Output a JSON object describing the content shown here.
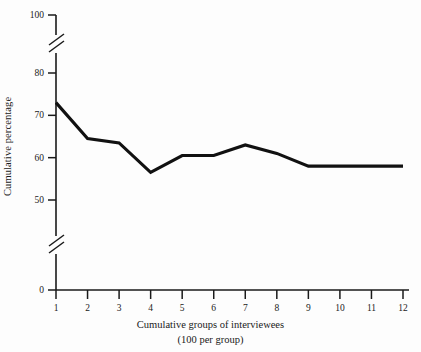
{
  "chart_data": {
    "type": "line",
    "title": "",
    "xlabel": "Cumulative groups of interviewees",
    "xlabel_sub": "(100 per group)",
    "ylabel": "Cumulative percentage",
    "x": [
      1,
      2,
      3,
      4,
      5,
      6,
      7,
      8,
      9,
      10,
      11,
      12
    ],
    "values": [
      73,
      64.5,
      63.5,
      56.5,
      60.5,
      60.5,
      63,
      61,
      58,
      58,
      58,
      58
    ],
    "series": [
      {
        "name": "Cumulative percentage",
        "values": [
          73,
          64.5,
          63.5,
          56.5,
          60.5,
          60.5,
          63,
          61,
          58,
          58,
          58,
          58
        ]
      }
    ],
    "xtick_labels": [
      "1",
      "2",
      "3",
      "4",
      "5",
      "6",
      "7",
      "8",
      "9",
      "10",
      "11",
      "12"
    ],
    "ytick_labels": [
      "0",
      "50",
      "60",
      "70",
      "80",
      "100"
    ],
    "ytick_values": [
      0,
      50,
      60,
      70,
      80,
      100
    ],
    "ylim": [
      0,
      100
    ],
    "xlim": [
      1,
      12
    ],
    "axis_breaks": [
      {
        "between": [
          0,
          50
        ],
        "style": "double-slash"
      },
      {
        "between": [
          80,
          100
        ],
        "style": "double-slash"
      }
    ],
    "grid": false,
    "legend": "none",
    "line_color": "#111111",
    "axis_color": "#1a1a1a",
    "background_color": "#fdfdfd"
  }
}
